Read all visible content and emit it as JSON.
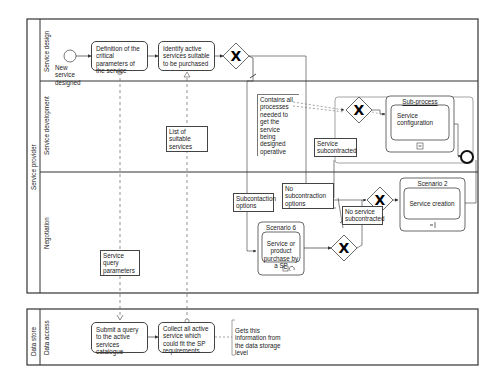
{
  "pools": [
    {
      "name": "Service provider",
      "lanes": [
        "Service design",
        "Service development",
        "Negotiation"
      ]
    },
    {
      "name": "Data store",
      "lanes": [
        "Data access"
      ]
    }
  ],
  "service_design": {
    "start_event": "New service designed",
    "task_1": "Definition of the critical parameters of the service",
    "task_2": "Identify active services suitable to be purchased"
  },
  "service_development": {
    "annotation": "Contains all processes needed to get the service being designed operative",
    "data_object": "List of suitable services",
    "subprocess_title": "Sub-process",
    "subprocess_task": "Service configuration",
    "condition_label": "Service subcontracted"
  },
  "negotiation": {
    "data_object": "Service query parameters",
    "subcontraction_options": "Subcontaction options",
    "no_subcontraction_options": "No subcontraction options",
    "no_service_subcontracted": "No service subcontracted",
    "scenario_6_title": "Scenario 6",
    "scenario_6_task": "Service or product purchase by a SP",
    "scenario_2_title": "Scenario 2",
    "scenario_2_task": "Service creation"
  },
  "data_access": {
    "task_1": "Submit a query to the active services catalogue",
    "task_2": "Collect all active service which could fit the SP requirements",
    "annotation": "Gets this information from the data storage level"
  }
}
